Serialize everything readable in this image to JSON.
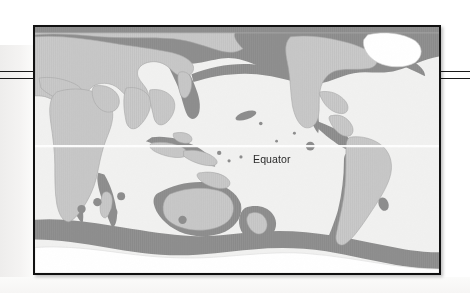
{
  "figure": {
    "type": "world-distribution-map",
    "frame": {
      "border_color": "#111111",
      "background_color": "#ffffff"
    },
    "labels": {
      "equator": "Equator"
    },
    "legend_colors": {
      "land": "#c9c9c9",
      "range_band": "#8f8f8f",
      "ocean": "#f2f2f2",
      "ice": "#ffffff",
      "outline": "#9a9a9a",
      "label_text": "#2b2b2b"
    },
    "rules": {
      "count": 4,
      "color": "#1a1a1a",
      "description": "two horizontal rules entering at left and two exiting at right"
    },
    "map_features": {
      "equator_line_color": "#ffffff",
      "continents": [
        "Eurasia",
        "Africa",
        "North America",
        "South America",
        "Australia",
        "Antarctica",
        "Greenland"
      ],
      "island_markers": 12
    }
  }
}
